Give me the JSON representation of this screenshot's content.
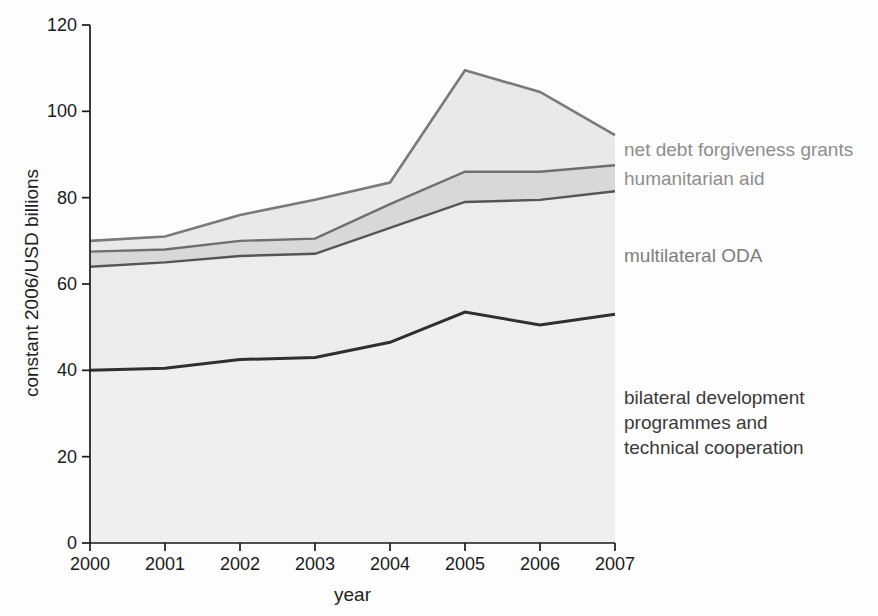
{
  "figure": {
    "type": "scanned stacked area chart",
    "background": "#fdfdfd",
    "axis_color": "#1a1a1a",
    "tick_label_color": "#1a1a1a"
  },
  "chart_data": {
    "type": "area",
    "stacked": true,
    "title": "",
    "xlabel": "year",
    "ylabel": "constant 2006/USD billions",
    "x": [
      2000,
      2001,
      2002,
      2003,
      2004,
      2005,
      2006,
      2007
    ],
    "x_tick_labels": [
      "2000",
      "2001",
      "2002",
      "2003",
      "2004",
      "2005",
      "2006",
      "2007"
    ],
    "ylim": [
      0,
      120
    ],
    "yticks": [
      0,
      20,
      40,
      60,
      80,
      100,
      120
    ],
    "y_tick_labels": [
      "0",
      "20",
      "40",
      "60",
      "80",
      "100",
      "120"
    ],
    "grid": false,
    "legend_position": "annotations-right-of-areas",
    "series": [
      {
        "name": "bilateral development programmes and technical cooperation",
        "values": [
          40,
          40.5,
          42.5,
          43,
          46.5,
          53.5,
          50.5,
          53
        ],
        "cumulative_top": [
          40,
          40.5,
          42.5,
          43,
          46.5,
          53.5,
          50.5,
          53
        ],
        "fill": "#efefef",
        "line_color": "#2f2f2f",
        "line_width": 3
      },
      {
        "name": "multilateral ODA",
        "values": [
          24,
          24.5,
          24,
          24,
          26.5,
          25.5,
          29,
          28.5
        ],
        "cumulative_top": [
          64,
          65,
          66.5,
          67,
          73,
          79,
          79.5,
          81.5
        ],
        "fill": "#ececec",
        "line_color": "#555555",
        "line_width": 2.4
      },
      {
        "name": "humanitarian aid",
        "values": [
          3.5,
          3,
          3.5,
          3.5,
          5.5,
          7,
          6.5,
          6
        ],
        "cumulative_top": [
          67.5,
          68,
          70,
          70.5,
          78.5,
          86,
          86,
          87.5
        ],
        "fill": "#d8d8d8",
        "line_color": "#6f6f6f",
        "line_width": 2.4
      },
      {
        "name": "net debt forgiveness grants",
        "values": [
          2.5,
          3,
          6,
          9,
          5,
          23.5,
          18.5,
          7
        ],
        "cumulative_top": [
          70,
          71,
          76,
          79.5,
          83.5,
          109.5,
          104.5,
          94.5
        ],
        "fill": "#e9e9e9",
        "line_color": "#7a7a7a",
        "line_width": 2.6
      }
    ]
  },
  "axes": {
    "xlabel": "year",
    "ylabel": "constant 2006/USD billions"
  },
  "annotations": {
    "net_debt": {
      "text": "net debt forgiveness grants",
      "color": "#8d8d8d"
    },
    "humanitarian": {
      "text": "humanitarian aid",
      "color": "#8d8d8d"
    },
    "multilateral": {
      "text": "multilateral ODA",
      "color": "#7d7d7d"
    },
    "bilateral": {
      "lines": [
        "bilateral development",
        "programmes and",
        "technical cooperation"
      ],
      "color": "#3a3a3a"
    }
  }
}
